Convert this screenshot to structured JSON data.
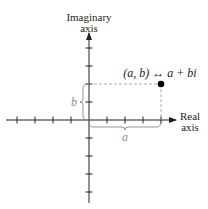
{
  "diagram": {
    "vertical_axis_label": [
      "Imaginary",
      "axis"
    ],
    "horizontal_axis_label": [
      "Real",
      "axis"
    ],
    "point_label": "(a, b) ↔ a + bi",
    "real_part_label": "a",
    "imaginary_part_label": "b",
    "ticks_x": [
      -4,
      -3,
      -2,
      -1,
      1,
      2,
      3,
      4
    ],
    "ticks_y": [
      -4,
      -3,
      -2,
      -1,
      1,
      2,
      3,
      4
    ],
    "point": {
      "x": 4,
      "y": 2
    },
    "colors": {
      "axis": "#231f20",
      "brace": "#8a8a8a",
      "dashed": "#9a9a9a",
      "point": "#000000"
    }
  }
}
